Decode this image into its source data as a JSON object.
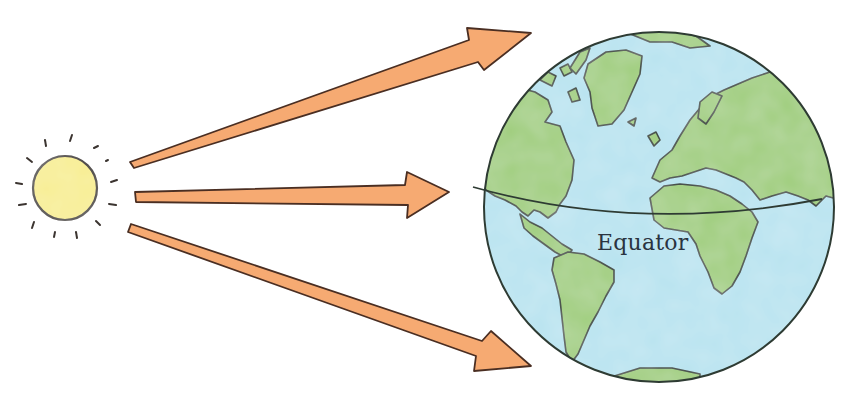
{
  "diagram": {
    "type": "sunlight-on-earth",
    "sun": {
      "icon": "sun-icon",
      "fill": "#f9ef8f",
      "stroke": "#3a2f2a",
      "ray_count": 12
    },
    "rays": [
      {
        "id": "top",
        "target": "northern-hemisphere",
        "color": "#f4a36c"
      },
      {
        "id": "middle",
        "target": "equator",
        "color": "#f4a36c"
      },
      {
        "id": "bottom",
        "target": "southern-hemisphere",
        "color": "#f4a36c"
      }
    ],
    "earth": {
      "icon": "globe-icon",
      "ocean_color": "#b9e3ef",
      "land_color": "#9ccb78",
      "outline_color": "#2e3b33",
      "equator_label": "Equator"
    }
  }
}
